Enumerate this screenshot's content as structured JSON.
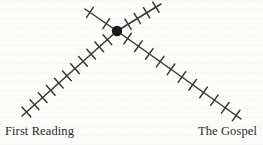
{
  "figure": {
    "kind": "tick-marked-chevron-diagram",
    "background_color": "#fcfcfa",
    "ink_color": "#3a3835",
    "node_color": "#1a1a1a",
    "label_color": "#2b2a28"
  },
  "labels": {
    "left": "First Reading",
    "right": "The Gospel"
  },
  "chart_data": {
    "type": "line",
    "title": "",
    "xlabel": "",
    "ylabel": "",
    "grid": false,
    "legend": "none",
    "annotations": [
      "First Reading",
      "The Gospel"
    ],
    "node": {
      "name": "center-node",
      "x": 117,
      "y": 31,
      "radius": 5.2
    },
    "series": [
      {
        "name": "first-reading-arm",
        "from": {
          "x": 117,
          "y": 31
        },
        "to": {
          "x": 22,
          "y": 116
        },
        "tick_count": 11,
        "tick_length": 13
      },
      {
        "name": "the-gospel-arm",
        "from": {
          "x": 117,
          "y": 31
        },
        "to": {
          "x": 241,
          "y": 119
        },
        "tick_count": 11,
        "tick_length": 13
      },
      {
        "name": "upper-left-stub",
        "from": {
          "x": 117,
          "y": 31
        },
        "to": {
          "x": 85,
          "y": 9
        },
        "tick_count": 2,
        "tick_length": 12
      },
      {
        "name": "upper-right-arm",
        "from": {
          "x": 117,
          "y": 31
        },
        "to": {
          "x": 161,
          "y": 4
        },
        "tick_count": 4,
        "tick_length": 12
      }
    ]
  }
}
